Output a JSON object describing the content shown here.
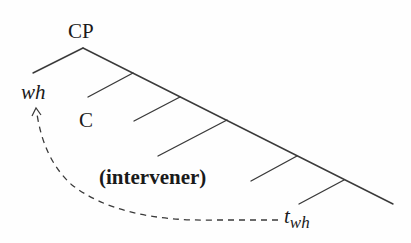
{
  "diagram": {
    "type": "syntax-tree",
    "root": {
      "label": "CP"
    },
    "labels": {
      "root": "CP",
      "wh": "wh",
      "complementizer": "C",
      "intervener": "(intervener)",
      "trace_base": "t",
      "trace_subscript": "wh"
    },
    "movement": {
      "from": "t_wh",
      "to": "wh",
      "style": "dashed-curve-with-arrow"
    },
    "colors": {
      "line": "#3a3a3a",
      "text": "#1a1a1a",
      "background": "#fefefe"
    }
  }
}
